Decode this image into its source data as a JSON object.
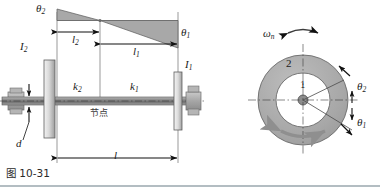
{
  "figure": {
    "caption": "图 10-31",
    "caption_number": "10-31"
  },
  "mode_shape_diagram": {
    "name": "angular-deflection-mode-shape",
    "labels": {
      "theta2": "θ",
      "theta2_sub": "2",
      "theta1": "θ",
      "theta1_sub": "1"
    },
    "dimensions": [
      {
        "name": "l2",
        "symbol": "l",
        "sub": "2"
      },
      {
        "name": "l1",
        "symbol": "l",
        "sub": "1"
      },
      {
        "name": "l",
        "symbol": "l",
        "sub": ""
      }
    ]
  },
  "shaft_assembly": {
    "name": "shaft-with-two-discs",
    "disc_left": {
      "label": "I",
      "sub": "2"
    },
    "disc_right": {
      "label": "I",
      "sub": "1"
    },
    "stiffness_left": {
      "label": "k",
      "sub": "2"
    },
    "stiffness_right": {
      "label": "k",
      "sub": "1"
    },
    "node_label": "节点",
    "shaft_diameter": {
      "label": "d",
      "sub": ""
    }
  },
  "cross_section_diagram": {
    "name": "annular-cross-section",
    "natural_frequency": {
      "symbol": "ω",
      "sub": "n"
    },
    "region_outer_label": "2",
    "region_inner_label": "1",
    "angle_outer": {
      "symbol": "θ",
      "sub": "2"
    },
    "angle_inner": {
      "symbol": "θ",
      "sub": "1"
    }
  },
  "colors": {
    "triangle_fill": "#a8a8a8",
    "triangle_stroke": "#555555",
    "disc_fill_light": "#e8e8e8",
    "disc_fill_dark": "#9a9a9a",
    "shaft_fill": "#8e8e8e",
    "annulus_fill": "#a9a9a9",
    "line": "#1b1b1b",
    "rule": "#9aa7ae",
    "background": "#ffffff"
  }
}
